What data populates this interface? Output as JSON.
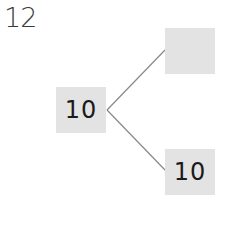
{
  "problem": {
    "number": "12"
  },
  "tree": {
    "root": {
      "value": "10"
    },
    "top_branch": {
      "value": ""
    },
    "bottom_branch": {
      "value": "10"
    }
  },
  "colors": {
    "box_fill": "#e3e3e3",
    "line": "#888888",
    "text": "#1a1a1a"
  }
}
